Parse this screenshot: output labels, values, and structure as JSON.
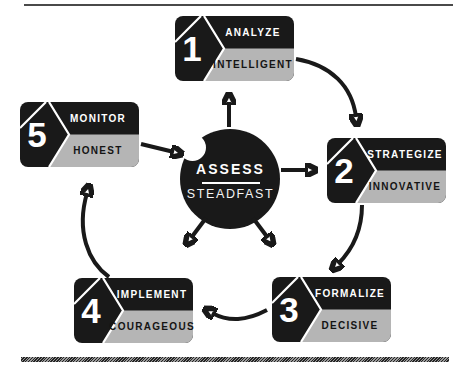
{
  "center": {
    "title": "ASSESS",
    "subtitle": "STEADFAST"
  },
  "steps": [
    {
      "num": "1",
      "label": "ANALYZE",
      "trait": "INTELLIGENT"
    },
    {
      "num": "2",
      "label": "STRATEGIZE",
      "trait": "INNOVATIVE"
    },
    {
      "num": "3",
      "label": "FORMALIZE",
      "trait": "DECISIVE"
    },
    {
      "num": "4",
      "label": "IMPLEMENT",
      "trait": "COURAGEOUS"
    },
    {
      "num": "5",
      "label": "MONITOR",
      "trait": "HONEST"
    }
  ],
  "colors": {
    "black": "#191919",
    "gray": "#b5b5b5",
    "white": "#ffffff"
  }
}
